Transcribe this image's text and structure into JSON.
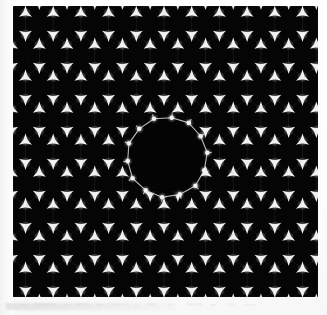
{
  "page": {
    "background_color": "#ffffff",
    "artifact_color": "#d9d9d9"
  },
  "figure": {
    "name": "honeycomb-lattice-micrograph",
    "panel": {
      "x": 13,
      "y": 6,
      "width": 305,
      "height": 291,
      "background_color": "#050505",
      "feature_color": "#f2f2f2",
      "bond_color": "#6e6e6e"
    },
    "lattice": {
      "type": "honeycomb",
      "column_spacing_px": 27.7,
      "row_spacing_px": 32.0,
      "vertex_half_gap_px": 11.0,
      "vertex_size_px": 7.5,
      "columns": 12,
      "rows": 10,
      "vertex_orientations": [
        "down",
        "up"
      ]
    },
    "defect": {
      "type": "circular-cavity",
      "center_x_px": 167,
      "center_y_px": 157,
      "radius_px": 40,
      "sides": 14,
      "ring_color": "#c9c9c9",
      "ring_stroke_px": 1.1
    }
  },
  "chart_data": {
    "type": "heatmap",
    "title": "",
    "xlabel": "",
    "ylabel": "",
    "grid": false,
    "legend": "none"
  }
}
